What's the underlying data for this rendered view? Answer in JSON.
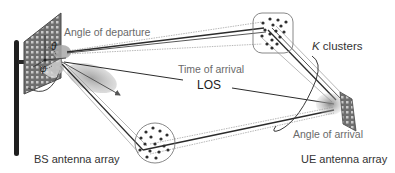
{
  "diagram": {
    "labels": {
      "angle_of_departure": "Angle of departure",
      "time_of_arrival": "Time of arrival",
      "los": "LOS",
      "k_symbol": "K",
      "k_clusters_suffix": " clusters",
      "angle_of_arrival": "Angle of arrival",
      "bs_antenna_array": "BS antenna array",
      "ue_antenna_array": "UE antenna array"
    },
    "symbols": {
      "theta": "θ",
      "phi": "φ"
    },
    "nodes": [
      {
        "id": "bs",
        "label": "BS antenna array",
        "type": "antenna-array"
      },
      {
        "id": "ue",
        "label": "UE antenna array",
        "type": "antenna-array"
      },
      {
        "id": "cluster-top",
        "label": "scatterer cluster",
        "shape": "rounded-square"
      },
      {
        "id": "cluster-bottom",
        "label": "scatterer cluster",
        "shape": "circle"
      }
    ],
    "edges": [
      {
        "from": "bs",
        "to": "ue",
        "label": "LOS"
      },
      {
        "from": "bs",
        "to": "cluster-top",
        "label": "multipath rays"
      },
      {
        "from": "cluster-top",
        "to": "ue",
        "label": "multipath rays"
      },
      {
        "from": "bs",
        "to": "cluster-bottom",
        "label": "multipath rays"
      },
      {
        "from": "cluster-bottom",
        "to": "ue",
        "label": "multipath rays"
      }
    ],
    "colors": {
      "ray_dark": "#2b2b2b",
      "ray_light": "#9a9a9a",
      "panel": "#6d6d6d",
      "lobe": "#9c9c9c",
      "cluster_border": "#7a7a7a",
      "scatterer": "#2e2e2e"
    }
  }
}
